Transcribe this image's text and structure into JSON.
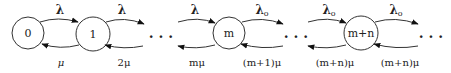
{
  "diagram": {
    "type": "birth-death state transition diagram",
    "states": [
      {
        "id": "s0",
        "label": "0",
        "cx": 28,
        "cy": 33,
        "r": 16
      },
      {
        "id": "s1",
        "label": "1",
        "cx": 93,
        "cy": 34,
        "r": 17
      },
      {
        "id": "sm",
        "label": "m",
        "cx": 229,
        "cy": 33,
        "r": 16
      },
      {
        "id": "smn",
        "label": "m+n",
        "cx": 361,
        "cy": 33,
        "r": 17
      }
    ],
    "ellipses": [
      {
        "id": "e1",
        "label": "· · ·",
        "x": 161,
        "y": 39
      },
      {
        "id": "e2",
        "label": "· · ·",
        "x": 296,
        "y": 39
      },
      {
        "id": "e3",
        "label": "· · ·",
        "x": 431,
        "y": 39
      }
    ],
    "forward_rates": [
      {
        "from": "0",
        "to": "1",
        "label": "λ",
        "sub": "",
        "x": 60,
        "y": 12
      },
      {
        "from": "1",
        "to": "…",
        "label": "λ",
        "sub": "",
        "x": 122,
        "y": 12
      },
      {
        "from": "…",
        "to": "m",
        "label": "λ",
        "sub": "",
        "x": 195,
        "y": 12
      },
      {
        "from": "m",
        "to": "…",
        "label": "λ",
        "sub": "o",
        "x": 262,
        "y": 12
      },
      {
        "from": "…",
        "to": "m+n",
        "label": "λ",
        "sub": "o",
        "x": 329,
        "y": 12
      },
      {
        "from": "m+n",
        "to": "…",
        "label": "λ",
        "sub": "o",
        "x": 396,
        "y": 12
      }
    ],
    "backward_rates": [
      {
        "from": "1",
        "to": "0",
        "label": "μ",
        "x": 61,
        "y": 66
      },
      {
        "from": "…",
        "to": "1",
        "label": "2μ",
        "x": 124,
        "y": 66
      },
      {
        "from": "m",
        "to": "…",
        "label": "mμ",
        "x": 197,
        "y": 66
      },
      {
        "from": "…",
        "to": "m",
        "label": "(m+1)μ",
        "x": 262,
        "y": 66
      },
      {
        "from": "m+n",
        "to": "…",
        "label": "(m+n)μ",
        "x": 335,
        "y": 66
      },
      {
        "from": "…",
        "to": "m+n",
        "label": "(m+n)μ",
        "x": 400,
        "y": 66
      }
    ]
  }
}
